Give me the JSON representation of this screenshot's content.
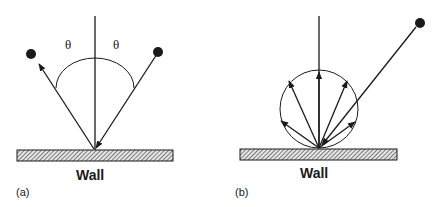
{
  "figure": {
    "panels": [
      {
        "id": "a",
        "panel_label": "(a)",
        "wall_label": "Wall",
        "description": "Specular reflection",
        "angle_labels": [
          "θ",
          "θ"
        ],
        "incident_ray": "from upper right particle to wall",
        "reflected_ray": "from wall to upper left particle"
      },
      {
        "id": "b",
        "panel_label": "(b)",
        "wall_label": "Wall",
        "description": "Diffuse reflection",
        "reflected_ray_count": 5,
        "incident_ray": "from upper right particle to wall"
      }
    ],
    "colors": {
      "line": "#1a1a1a",
      "wall_fill": "#d9d9d9",
      "hatch": "#333333",
      "particle": "#1a1a1a"
    }
  }
}
